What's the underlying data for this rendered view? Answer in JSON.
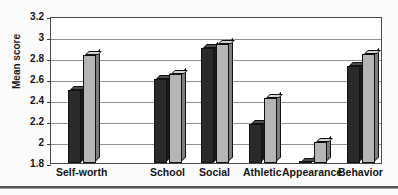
{
  "figure": {
    "name": "mean-score-grouped-bar-chart"
  },
  "axis": {
    "ylabel": "Mean score",
    "yticks": [
      "3.2",
      "3",
      "2.8",
      "2.6",
      "2.4",
      "2.2",
      "2",
      "1.8"
    ]
  },
  "categories": [
    "Self-worth",
    "School",
    "Social",
    "Athletic",
    "Appearance",
    "Behavior"
  ],
  "colors": {
    "series_1": "#2a2a2a",
    "series_2": "#b5b5b5",
    "axis": "#4a4a4a",
    "grid": "#8f8f8f",
    "text": "#141414",
    "background": "#ffffff"
  },
  "chart_data": {
    "type": "bar",
    "title": "",
    "subtitle": "",
    "xlabel": "",
    "ylabel": "Mean score",
    "categories": [
      "Self-worth",
      "School",
      "Social",
      "Athletic",
      "Appearance",
      "Behavior"
    ],
    "series": [
      {
        "name": "Series 1",
        "color": "#2a2a2a",
        "values": [
          2.5,
          2.6,
          2.9,
          2.17,
          1.8,
          2.72
        ]
      },
      {
        "name": "Series 2",
        "color": "#b5b5b5",
        "values": [
          2.83,
          2.65,
          2.93,
          2.42,
          2.0,
          2.84
        ]
      }
    ],
    "ylim": [
      1.8,
      3.2
    ],
    "ytick_step": 0.2,
    "ytick_labels": [
      "1.8",
      "2",
      "2.2",
      "2.4",
      "2.6",
      "2.8",
      "3",
      "3.2"
    ],
    "grid": "horizontal",
    "legend": "none",
    "style": "3d-grouped-bar-grayscale"
  }
}
